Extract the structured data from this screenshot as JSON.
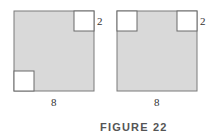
{
  "figure": {
    "caption": "FIGURE 22",
    "colors": {
      "shaded": "#d9d9d9",
      "outline": "#7a7a7a",
      "cutout": "#ffffff",
      "text": "#333333"
    },
    "panels": [
      {
        "name": "left",
        "side_label": "8",
        "corner_label": "2",
        "square_size": 8,
        "cutout_size": 2,
        "cutouts": [
          "top-right",
          "bottom-left"
        ]
      },
      {
        "name": "right",
        "side_label": "8",
        "corner_label": "2",
        "square_size": 8,
        "cutout_size": 2,
        "cutouts": [
          "top-left",
          "top-right"
        ]
      }
    ]
  }
}
